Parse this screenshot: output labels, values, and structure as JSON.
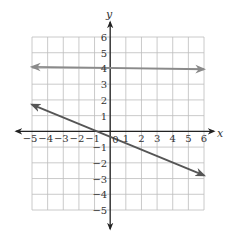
{
  "chart_data": {
    "type": "line",
    "title": "",
    "xlabel": "x",
    "ylabel": "y",
    "xlim": [
      -5,
      6
    ],
    "ylim": [
      -5,
      6
    ],
    "grid": true,
    "x_ticks": [
      "-5",
      "-4",
      "-3",
      "-2",
      "-1",
      "0",
      "1",
      "2",
      "3",
      "4",
      "5",
      "6"
    ],
    "y_ticks": [
      "6",
      "5",
      "4",
      "3",
      "2",
      "1",
      "-1",
      "-2",
      "-3",
      "-4",
      "-5"
    ],
    "series": [
      {
        "name": "horizontal line",
        "points": [
          [
            -5,
            4.1
          ],
          [
            6,
            3.95
          ]
        ],
        "color": "#8a8a8a"
      },
      {
        "name": "decreasing line",
        "points": [
          [
            -5,
            1.7
          ],
          [
            6,
            -2.8
          ]
        ],
        "color": "#555555"
      }
    ]
  },
  "labels": {
    "x_axis": "x",
    "y_axis": "y",
    "origin": "0",
    "x_neg": [
      "-5",
      "-4",
      "-3",
      "-2",
      "-1"
    ],
    "x_pos": [
      "1",
      "2",
      "3",
      "4",
      "5",
      "6"
    ],
    "y_pos": [
      "1",
      "2",
      "3",
      "4",
      "5",
      "6"
    ],
    "y_neg": [
      "-1",
      "-2",
      "-3",
      "-4",
      "-5"
    ]
  }
}
